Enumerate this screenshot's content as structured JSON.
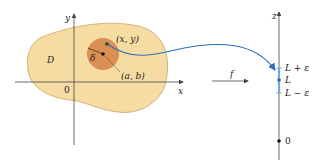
{
  "colors": {
    "region_fill": "#f6dcA3",
    "region_stroke": "#c9a56a",
    "disk_fill": "#dc8f52",
    "axis": "#444444",
    "arrow": "#2f6fb8",
    "interval": "#6fa8dc",
    "point": "#1d3f2a"
  },
  "plane": {
    "region_label": "D",
    "x_axis_label": "x",
    "y_axis_label": "y",
    "origin_label": "0",
    "point_xy_label": "(x, y)",
    "point_ab_label": "(a, b)",
    "radius_label": "δ"
  },
  "mapping": {
    "function_label": "f"
  },
  "z_axis": {
    "axis_label": "z",
    "upper_label": "L + ε",
    "center_label": "L",
    "lower_label": "L − ε",
    "origin_label": "0"
  }
}
